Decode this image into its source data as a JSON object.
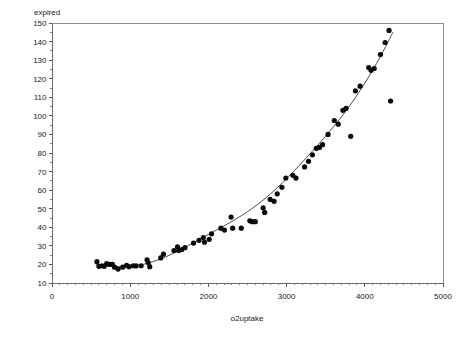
{
  "chart_data": {
    "type": "scatter",
    "title": "",
    "subtitle": "",
    "xlabel": "o2uptake",
    "ylabel": "expired",
    "xlim": [
      0,
      5000
    ],
    "ylim": [
      10,
      150
    ],
    "grid": false,
    "legend": null,
    "legend_position": "none",
    "x_ticks": [
      0,
      1000,
      2000,
      3000,
      4000,
      5000
    ],
    "x_tick_labels": [
      "0",
      "1000",
      "2000",
      "3000",
      "4000",
      "5000"
    ],
    "x_minor_tick_step": 100,
    "y_ticks": [
      10,
      20,
      30,
      40,
      50,
      60,
      70,
      80,
      90,
      100,
      110,
      120,
      130,
      140,
      150
    ],
    "y_tick_labels": [
      "10",
      "20",
      "30",
      "40",
      "50",
      "60",
      "70",
      "80",
      "90",
      "100",
      "110",
      "120",
      "130",
      "140",
      "150"
    ],
    "y_minor_tick_step": 5,
    "point_color": "#0a0a0a",
    "point_radius": 2.6,
    "curve_color": "#3a3a3a",
    "frame_color": "#8d8d8d",
    "points": [
      [
        574,
        21.5
      ],
      [
        600,
        19.0
      ],
      [
        640,
        19.3
      ],
      [
        668,
        19.0
      ],
      [
        700,
        20.5
      ],
      [
        735,
        20.0
      ],
      [
        772,
        20.0
      ],
      [
        800,
        18.5
      ],
      [
        845,
        17.5
      ],
      [
        905,
        18.5
      ],
      [
        955,
        19.5
      ],
      [
        985,
        18.8
      ],
      [
        1040,
        19.3
      ],
      [
        1075,
        19.2
      ],
      [
        1140,
        19.3
      ],
      [
        1215,
        22.5
      ],
      [
        1230,
        21.0
      ],
      [
        1250,
        18.8
      ],
      [
        1390,
        23.5
      ],
      [
        1425,
        25.5
      ],
      [
        1560,
        27.5
      ],
      [
        1605,
        29.5
      ],
      [
        1620,
        27.5
      ],
      [
        1660,
        28.0
      ],
      [
        1700,
        29.0
      ],
      [
        1810,
        31.5
      ],
      [
        1880,
        33.0
      ],
      [
        1935,
        34.5
      ],
      [
        1950,
        32.0
      ],
      [
        2010,
        33.5
      ],
      [
        2040,
        36.5
      ],
      [
        2160,
        39.5
      ],
      [
        2205,
        38.5
      ],
      [
        2290,
        45.5
      ],
      [
        2310,
        39.5
      ],
      [
        2420,
        39.5
      ],
      [
        2530,
        43.5
      ],
      [
        2560,
        43.0
      ],
      [
        2600,
        43.0
      ],
      [
        2700,
        50.5
      ],
      [
        2720,
        48.0
      ],
      [
        2790,
        55.0
      ],
      [
        2840,
        54.0
      ],
      [
        2880,
        58.0
      ],
      [
        2940,
        61.5
      ],
      [
        2990,
        66.5
      ],
      [
        3080,
        68.0
      ],
      [
        3120,
        66.5
      ],
      [
        3230,
        72.5
      ],
      [
        3280,
        75.5
      ],
      [
        3330,
        79.0
      ],
      [
        3380,
        82.5
      ],
      [
        3420,
        83.0
      ],
      [
        3460,
        84.5
      ],
      [
        3530,
        90.0
      ],
      [
        3610,
        97.5
      ],
      [
        3660,
        95.5
      ],
      [
        3720,
        103.0
      ],
      [
        3760,
        104.0
      ],
      [
        3820,
        89.0
      ],
      [
        3880,
        113.5
      ],
      [
        3940,
        116.0
      ],
      [
        4050,
        126.0
      ],
      [
        4080,
        124.5
      ],
      [
        4120,
        125.5
      ],
      [
        4200,
        133.0
      ],
      [
        4260,
        139.5
      ],
      [
        4310,
        146.0
      ],
      [
        4330,
        108.0
      ]
    ],
    "fit_curve": [
      [
        560,
        20.2
      ],
      [
        700,
        19.2
      ],
      [
        850,
        18.7
      ],
      [
        1000,
        18.9
      ],
      [
        1150,
        19.9
      ],
      [
        1300,
        21.6
      ],
      [
        1450,
        24.0
      ],
      [
        1600,
        27.0
      ],
      [
        1750,
        30.3
      ],
      [
        1900,
        33.8
      ],
      [
        2050,
        37.3
      ],
      [
        2200,
        40.8
      ],
      [
        2350,
        44.4
      ],
      [
        2500,
        48.4
      ],
      [
        2650,
        53.0
      ],
      [
        2800,
        58.2
      ],
      [
        2950,
        64.1
      ],
      [
        3100,
        70.5
      ],
      [
        3250,
        77.3
      ],
      [
        3400,
        84.3
      ],
      [
        3550,
        91.6
      ],
      [
        3700,
        99.4
      ],
      [
        3850,
        108.0
      ],
      [
        4000,
        117.6
      ],
      [
        4150,
        128.2
      ],
      [
        4300,
        140.0
      ],
      [
        4360,
        145.2
      ]
    ]
  },
  "plot_area": {
    "left": 52,
    "top": 23,
    "right": 443,
    "bottom": 283
  }
}
